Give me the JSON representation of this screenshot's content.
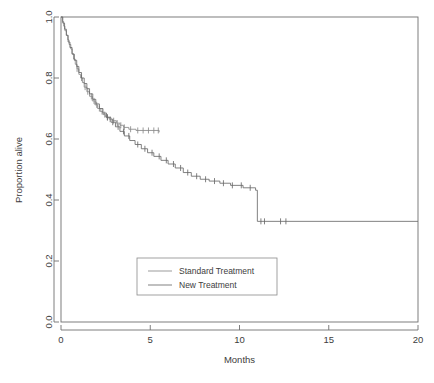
{
  "figure": {
    "title": "",
    "width": 434,
    "height": 383
  },
  "chart_data": {
    "type": "line",
    "subtype": "kaplan-meier-step",
    "title": "",
    "xlabel": "Months",
    "ylabel": "Proportion alive",
    "xlim": [
      0,
      20
    ],
    "ylim": [
      0,
      1
    ],
    "xticks": [
      0,
      5,
      10,
      15,
      20
    ],
    "xticklabels": [
      "0",
      "5",
      "10",
      "15",
      "20"
    ],
    "yticks": [
      0.0,
      0.2,
      0.4,
      0.6,
      0.8,
      1.0
    ],
    "yticklabels": [
      "0.0",
      "0.2",
      "0.4",
      "0.6",
      "0.8",
      "1.0"
    ],
    "grid": false,
    "legend_position": "lower-center-inside",
    "colors": {
      "standard": "#8a8a8a",
      "new": "#6a6a6a",
      "axis": "#6f6f6f",
      "text": "#3d3d3d",
      "background": "#ffffff"
    },
    "series": [
      {
        "name": "Standard Treatment",
        "color": "#8a8a8a",
        "steps": [
          [
            0.0,
            1.0
          ],
          [
            0.08,
            0.985
          ],
          [
            0.15,
            0.97
          ],
          [
            0.22,
            0.955
          ],
          [
            0.3,
            0.94
          ],
          [
            0.38,
            0.925
          ],
          [
            0.45,
            0.91
          ],
          [
            0.55,
            0.895
          ],
          [
            0.62,
            0.88
          ],
          [
            0.7,
            0.862
          ],
          [
            0.8,
            0.845
          ],
          [
            0.9,
            0.83
          ],
          [
            1.0,
            0.812
          ],
          [
            1.1,
            0.8
          ],
          [
            1.2,
            0.785
          ],
          [
            1.3,
            0.77
          ],
          [
            1.45,
            0.755
          ],
          [
            1.6,
            0.74
          ],
          [
            1.75,
            0.725
          ],
          [
            1.9,
            0.712
          ],
          [
            2.05,
            0.7
          ],
          [
            2.2,
            0.69
          ],
          [
            2.35,
            0.68
          ],
          [
            2.5,
            0.672
          ],
          [
            2.7,
            0.665
          ],
          [
            2.9,
            0.66
          ],
          [
            3.1,
            0.652
          ],
          [
            3.3,
            0.645
          ],
          [
            3.5,
            0.638
          ],
          [
            3.8,
            0.632
          ],
          [
            4.2,
            0.628
          ],
          [
            5.5,
            0.622
          ]
        ],
        "censor_times": [
          0.9,
          1.15,
          1.35,
          1.5,
          1.7,
          1.85,
          2.0,
          2.15,
          2.3,
          2.45,
          2.6,
          2.75,
          2.95,
          3.15,
          3.35,
          3.55,
          3.9,
          4.3,
          4.6,
          4.9,
          5.2,
          5.45
        ]
      },
      {
        "name": "New Treatment",
        "color": "#6a6a6a",
        "steps": [
          [
            0.0,
            1.0
          ],
          [
            0.1,
            0.98
          ],
          [
            0.2,
            0.96
          ],
          [
            0.3,
            0.94
          ],
          [
            0.4,
            0.918
          ],
          [
            0.5,
            0.9
          ],
          [
            0.62,
            0.878
          ],
          [
            0.75,
            0.858
          ],
          [
            0.88,
            0.838
          ],
          [
            1.0,
            0.818
          ],
          [
            1.15,
            0.8
          ],
          [
            1.3,
            0.782
          ],
          [
            1.45,
            0.765
          ],
          [
            1.6,
            0.748
          ],
          [
            1.78,
            0.73
          ],
          [
            1.95,
            0.715
          ],
          [
            2.15,
            0.7
          ],
          [
            2.35,
            0.685
          ],
          [
            2.55,
            0.67
          ],
          [
            2.8,
            0.655
          ],
          [
            3.05,
            0.64
          ],
          [
            3.3,
            0.625
          ],
          [
            3.55,
            0.61
          ],
          [
            3.85,
            0.595
          ],
          [
            4.15,
            0.582
          ],
          [
            4.5,
            0.568
          ],
          [
            4.85,
            0.555
          ],
          [
            5.2,
            0.543
          ],
          [
            5.6,
            0.53
          ],
          [
            6.0,
            0.518
          ],
          [
            6.4,
            0.505
          ],
          [
            6.85,
            0.49
          ],
          [
            7.3,
            0.478
          ],
          [
            7.8,
            0.468
          ],
          [
            8.3,
            0.462
          ],
          [
            8.9,
            0.455
          ],
          [
            9.5,
            0.448
          ],
          [
            10.2,
            0.44
          ],
          [
            10.9,
            0.432
          ],
          [
            11.0,
            0.33
          ],
          [
            20.0,
            0.33
          ]
        ],
        "censor_times": [
          2.6,
          2.9,
          3.2,
          3.5,
          3.8,
          4.3,
          4.7,
          5.1,
          5.5,
          5.9,
          6.3,
          6.7,
          7.1,
          7.6,
          8.1,
          8.6,
          9.1,
          9.6,
          10.1,
          10.6,
          11.2,
          11.4,
          12.3,
          12.6
        ]
      }
    ],
    "legend": [
      {
        "label": "Standard Treatment",
        "color": "#8a8a8a"
      },
      {
        "label": "New Treatment",
        "color": "#6a6a6a"
      }
    ]
  }
}
